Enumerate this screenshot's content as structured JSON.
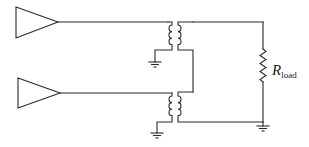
{
  "diagram": {
    "type": "circuit-schematic",
    "components": {
      "amplifier_top": {
        "label": ""
      },
      "amplifier_bottom": {
        "label": ""
      },
      "transformer_top": {
        "label": ""
      },
      "transformer_bottom": {
        "label": ""
      },
      "resistor": {
        "symbol": "R",
        "subscript": "load"
      },
      "grounds": 3
    },
    "colors": {
      "line": "#2a2a2a",
      "background": "#ffffff"
    }
  }
}
